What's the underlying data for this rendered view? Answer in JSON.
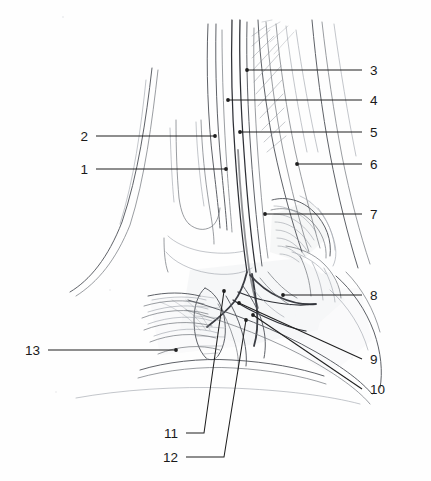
{
  "figure": {
    "type": "anatomical-illustration",
    "background_color": "#fefefe",
    "ink_color": "#2e3036",
    "leader_color": "#1f1f1f",
    "width": 431,
    "height": 481
  },
  "labels": [
    {
      "id": "1",
      "text": "1",
      "text_x": 88,
      "text_y": 174,
      "anchor": "end",
      "side": "left",
      "path": "M 96 169 L 226 169",
      "dot_x": 226,
      "dot_y": 169
    },
    {
      "id": "2",
      "text": "2",
      "text_x": 88,
      "text_y": 141,
      "anchor": "end",
      "side": "left",
      "path": "M 96 136 L 215 136",
      "dot_x": 215,
      "dot_y": 136
    },
    {
      "id": "3",
      "text": "3",
      "text_x": 370,
      "text_y": 75,
      "anchor": "start",
      "side": "right",
      "path": "M 362 70 L 247 70",
      "dot_x": 247,
      "dot_y": 70
    },
    {
      "id": "4",
      "text": "4",
      "text_x": 370,
      "text_y": 105,
      "anchor": "start",
      "side": "right",
      "path": "M 362 100 L 228 100",
      "dot_x": 228,
      "dot_y": 100
    },
    {
      "id": "5",
      "text": "5",
      "text_x": 370,
      "text_y": 137,
      "anchor": "start",
      "side": "right",
      "path": "M 362 132 L 240 132",
      "dot_x": 240,
      "dot_y": 132
    },
    {
      "id": "6",
      "text": "6",
      "text_x": 370,
      "text_y": 169,
      "anchor": "start",
      "side": "right",
      "path": "M 362 164 L 297 164",
      "dot_x": 297,
      "dot_y": 164
    },
    {
      "id": "7",
      "text": "7",
      "text_x": 370,
      "text_y": 219,
      "anchor": "start",
      "side": "right",
      "path": "M 362 214 L 265 214",
      "dot_x": 265,
      "dot_y": 214
    },
    {
      "id": "8",
      "text": "8",
      "text_x": 370,
      "text_y": 300,
      "anchor": "start",
      "side": "right",
      "path": "M 362 295 L 283 295",
      "dot_x": 283,
      "dot_y": 295
    },
    {
      "id": "9",
      "text": "9",
      "text_x": 370,
      "text_y": 364,
      "anchor": "start",
      "side": "right",
      "path": "M 362 359 L 239 303",
      "dot_x": 239,
      "dot_y": 303
    },
    {
      "id": "10",
      "text": "10",
      "text_x": 370,
      "text_y": 394,
      "anchor": "start",
      "side": "right",
      "path": "M 362 389 L 253 315",
      "dot_x": 253,
      "dot_y": 315
    },
    {
      "id": "11",
      "text": "11",
      "text_x": 178,
      "text_y": 438,
      "anchor": "end",
      "side": "bottom",
      "path": "M 186 433 L 204 433 L 224 291",
      "dot_x": 224,
      "dot_y": 291
    },
    {
      "id": "12",
      "text": "12",
      "text_x": 178,
      "text_y": 462,
      "anchor": "end",
      "side": "bottom",
      "path": "M 186 457 L 224 457 L 246 320",
      "dot_x": 246,
      "dot_y": 320
    },
    {
      "id": "13",
      "text": "13",
      "text_x": 40,
      "text_y": 355,
      "anchor": "end",
      "side": "left",
      "path": "M 48 350 L 176 350",
      "dot_x": 176,
      "dot_y": 350
    }
  ]
}
